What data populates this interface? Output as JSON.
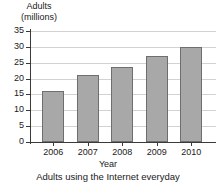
{
  "chart_data": {
    "type": "bar",
    "title": "",
    "caption": "Adults using the Internet everyday",
    "xlabel": "Year",
    "ylabel_lines": [
      "Adults",
      "(millions)"
    ],
    "ylabel": "Adults (millions)",
    "categories": [
      "2006",
      "2007",
      "2008",
      "2009",
      "2010"
    ],
    "values": [
      16,
      21,
      23.5,
      27,
      30
    ],
    "series": [
      {
        "name": "Adults using the Internet everyday",
        "values": [
          16,
          21,
          23.5,
          27,
          30
        ]
      }
    ],
    "ylim": [
      0,
      35
    ],
    "yticks": [
      0,
      5,
      10,
      15,
      20,
      25,
      30,
      35
    ],
    "ytick_labels": [
      "0",
      "5",
      "10",
      "15",
      "20",
      "25",
      "30",
      "35"
    ],
    "grid": true,
    "grid_axis": "y",
    "legend": false,
    "bar_color": "#a8a8a8",
    "bar_border_color": "#6e6e6e",
    "grid_color": "#d2d2d2",
    "axis_color": "#3a3a3a",
    "background": "#ffffff"
  }
}
